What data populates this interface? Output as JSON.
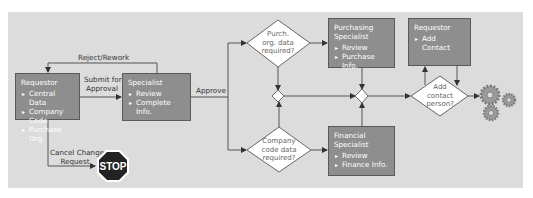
{
  "diagram": {
    "colors": {
      "background": "#dcdcdc",
      "box_fill": "#8e8e8e",
      "box_border": "#5a5a5a",
      "line": "#555555",
      "decision_fill": "#ffffff",
      "stop_fill": "#222222"
    },
    "boxes": {
      "requestor": {
        "title": "Requestor",
        "items": [
          "Central Data",
          "Company Code",
          "Purchase Org."
        ]
      },
      "specialist": {
        "title": "Specialist",
        "items": [
          "Review",
          "Complete Info."
        ]
      },
      "purchasing_specialist": {
        "title_line1": "Purchasing",
        "title_line2": "Specialist",
        "items": [
          "Review",
          "Purchase Info."
        ]
      },
      "financial_specialist": {
        "title_line1": "Financial",
        "title_line2": "Specialist",
        "items": [
          "Review",
          "Finance Info."
        ]
      },
      "requestor_contact": {
        "title": "Requestor",
        "items": [
          "Add Contact"
        ]
      }
    },
    "decisions": {
      "purch_org": {
        "line1": "Purch.",
        "line2": "org. data",
        "line3": "required?"
      },
      "company_code": {
        "line1": "Company",
        "line2": "code data",
        "line3": "required?"
      },
      "add_contact": {
        "line1": "Add",
        "line2": "contact",
        "line3": "person?"
      }
    },
    "edge_labels": {
      "reject_rework": "Reject/Rework",
      "submit_line1": "Submit for",
      "submit_line2": "Approval",
      "approve": "Approve",
      "cancel_line1": "Cancel Change",
      "cancel_line2": "Request"
    },
    "icons": {
      "stop": {
        "name": "stop-sign-icon",
        "text": "STOP"
      },
      "end": {
        "name": "gears-icon"
      }
    }
  }
}
